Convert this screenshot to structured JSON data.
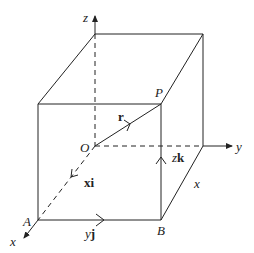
{
  "diagram": {
    "type": "3D coordinate box with position vector",
    "labels": {
      "z_axis": "z",
      "y_axis": "y",
      "x_axis": "x",
      "origin": "O",
      "point_P": "P",
      "point_A": "A",
      "point_B": "B",
      "vector_r": "r",
      "xi_coef": "x",
      "xi_unit": "i",
      "yj_coef": "y",
      "yj_unit": "j",
      "zk_coef": "z",
      "zk_unit": "k",
      "edge_x": "x"
    },
    "colors": {
      "line": "#222222",
      "background": "#ffffff"
    }
  }
}
